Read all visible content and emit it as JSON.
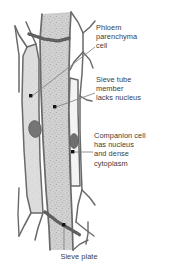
{
  "figure": {
    "background_color": "#ffffff",
    "line_color": "#5f5f5f",
    "text_color": "#3b3b3b",
    "cell_fill_color": "#d6d6d6",
    "sieve_tube_fill_color": "#cfcfcf",
    "nucleus_color": "#6e6e6e",
    "companion_lumen_color": "#f4f4f4",
    "leader_dot_color": "#111111"
  },
  "labels": {
    "phloem_parenchyma": "Phloem\nparenchyma\ncell",
    "sieve_tube": "Sieve tube\nmember\nlacks nucleus",
    "companion_cell": "Companion cell\nhas nucleus\nand dense\ncytoplasm",
    "sieve_plate": "Sieve plate"
  },
  "structures": [
    {
      "name": "phloem-parenchyma-cell",
      "label_key": "phloem_parenchyma"
    },
    {
      "name": "sieve-tube-member",
      "label_key": "sieve_tube"
    },
    {
      "name": "companion-cell",
      "label_key": "companion_cell"
    },
    {
      "name": "sieve-plate",
      "label_key": "sieve_plate"
    }
  ]
}
